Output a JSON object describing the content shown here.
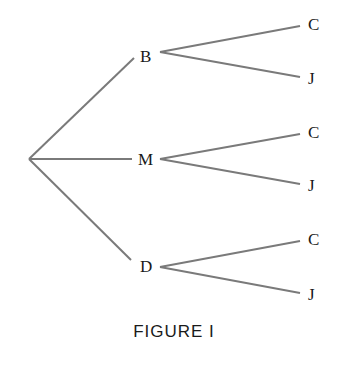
{
  "diagram": {
    "type": "tree",
    "root": "",
    "level1": [
      {
        "label": "B",
        "children": [
          "C",
          "J"
        ]
      },
      {
        "label": "M",
        "children": [
          "C",
          "J"
        ]
      },
      {
        "label": "D",
        "children": [
          "C",
          "J"
        ]
      }
    ]
  },
  "caption": "FIGURE I"
}
